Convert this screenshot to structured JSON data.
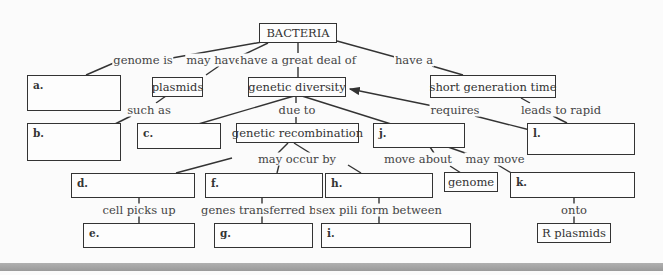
{
  "nodes": {
    "bacteria": {
      "text": "BACTERIA",
      "x": 259,
      "y": 23,
      "w": 78,
      "h": 20
    },
    "a": {
      "text": "a.",
      "x": 27,
      "y": 75,
      "w": 94,
      "h": 36
    },
    "plasmids": {
      "text": "plasmids",
      "x": 152,
      "y": 77,
      "w": 51,
      "h": 20
    },
    "genetic_diversity": {
      "text": "genetic diversity",
      "x": 248,
      "y": 77,
      "w": 98,
      "h": 20
    },
    "short_generation_time": {
      "text": "short generation time",
      "x": 430,
      "y": 75,
      "w": 126,
      "h": 23
    },
    "b": {
      "text": "b.",
      "x": 27,
      "y": 123,
      "w": 94,
      "h": 38
    },
    "c": {
      "text": "c.",
      "x": 137,
      "y": 123,
      "w": 84,
      "h": 26
    },
    "genetic_recombination": {
      "text": "genetic recombination",
      "x": 236,
      "y": 123,
      "w": 123,
      "h": 20
    },
    "j": {
      "text": "j.",
      "x": 373,
      "y": 123,
      "w": 92,
      "h": 25
    },
    "l": {
      "text": "l.",
      "x": 527,
      "y": 123,
      "w": 108,
      "h": 32
    },
    "d": {
      "text": "d.",
      "x": 71,
      "y": 173,
      "w": 124,
      "h": 25
    },
    "f": {
      "text": "f.",
      "x": 205,
      "y": 173,
      "w": 118,
      "h": 25
    },
    "h": {
      "text": "h.",
      "x": 325,
      "y": 173,
      "w": 108,
      "h": 25
    },
    "genome": {
      "text": "genome",
      "x": 444,
      "y": 172,
      "w": 54,
      "h": 20
    },
    "k": {
      "text": "k.",
      "x": 510,
      "y": 172,
      "w": 125,
      "h": 26
    },
    "e": {
      "text": "e.",
      "x": 83,
      "y": 223,
      "w": 112,
      "h": 25
    },
    "g": {
      "text": "g.",
      "x": 214,
      "y": 223,
      "w": 99,
      "h": 25
    },
    "i": {
      "text": "i.",
      "x": 321,
      "y": 223,
      "w": 150,
      "h": 25
    },
    "r_plasmids": {
      "text": "R plasmids",
      "x": 537,
      "y": 223,
      "w": 74,
      "h": 20
    }
  },
  "links": {
    "genome_is": {
      "text": "genome is",
      "x": 143,
      "y": 60
    },
    "may_have": {
      "text": "may have",
      "x": 214,
      "y": 60
    },
    "have_great_deal": {
      "text": "have a great deal of",
      "x": 298,
      "y": 60
    },
    "have_a": {
      "text": "have a",
      "x": 414,
      "y": 60
    },
    "such_as": {
      "text": "such as",
      "x": 149,
      "y": 110
    },
    "due_to": {
      "text": "due to",
      "x": 297,
      "y": 110
    },
    "requires": {
      "text": "requires",
      "x": 455,
      "y": 110
    },
    "leads_to_rapid": {
      "text": "leads to rapid",
      "x": 561,
      "y": 110
    },
    "may_occur_by": {
      "text": "may occur by",
      "x": 297,
      "y": 159
    },
    "move_about": {
      "text": "move about",
      "x": 418,
      "y": 159
    },
    "may_move": {
      "text": "may move",
      "x": 495,
      "y": 159
    },
    "cell_picks_up": {
      "text": "cell picks up",
      "x": 139,
      "y": 210
    },
    "genes_transferred_by": {
      "text": "genes transferred by",
      "x": 262,
      "y": 210
    },
    "sex_pili_form_between": {
      "text": "sex pili form between",
      "x": 379,
      "y": 210
    },
    "onto": {
      "text": "onto",
      "x": 574,
      "y": 210
    }
  }
}
